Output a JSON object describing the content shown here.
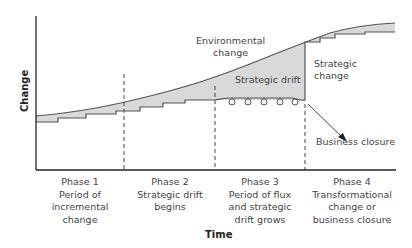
{
  "axes": {
    "y_label": "Change",
    "x_label": "Time"
  },
  "annotations": {
    "environmental_change_line1": "Environmental",
    "environmental_change_line2": "change",
    "strategic_drift": "Strategic drift",
    "strategic_change_line1": "Strategic",
    "strategic_change_line2": "change",
    "business_closure": "Business closure"
  },
  "phases": [
    {
      "title": "Phase 1",
      "desc_lines": [
        "Period of incremental",
        "change"
      ]
    },
    {
      "title": "Phase 2",
      "desc_lines": [
        "Strategic drift",
        "begins"
      ]
    },
    {
      "title": "Phase 3",
      "desc_lines": [
        "Period of flux",
        "and strategic",
        "drift grows"
      ]
    },
    {
      "title": "Phase 4",
      "desc_lines": [
        "Transformational",
        "change or",
        "business closure"
      ]
    }
  ],
  "colors": {
    "fill_gap": "#d9d9d9",
    "line": "#555555",
    "axis": "#222222"
  }
}
